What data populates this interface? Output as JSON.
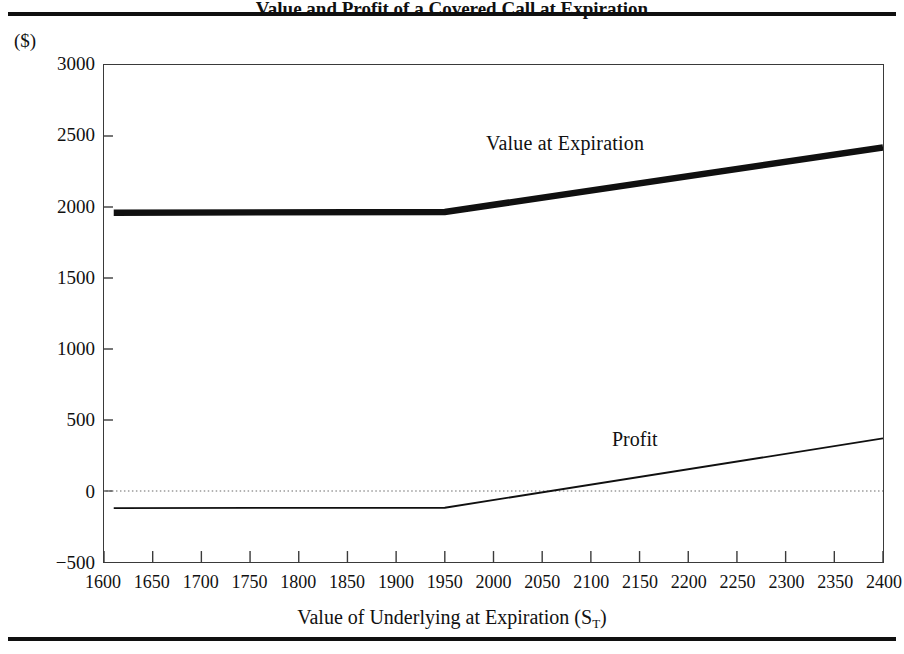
{
  "figure": {
    "caption": "Value and Profit of a Covered Call at Expiration",
    "unit_label": "($)"
  },
  "chart_data": {
    "type": "line",
    "title": "",
    "xlabel": "Value of Underlying at Expiration (S",
    "xlabel_sub": "T",
    "xlabel_suffix": ")",
    "ylabel": "($)",
    "xlim": [
      1600,
      2400
    ],
    "ylim": [
      -500,
      3000
    ],
    "xticks": [
      1600,
      1650,
      1700,
      1750,
      1800,
      1850,
      1900,
      1950,
      2000,
      2050,
      2100,
      2150,
      2200,
      2250,
      2300,
      2350,
      2400
    ],
    "yticks": [
      3000,
      2500,
      2000,
      1500,
      1000,
      500,
      0,
      -500
    ],
    "grid": false,
    "zero_line": {
      "value": 0,
      "style": "dotted"
    },
    "legend": "inline-annotations",
    "series": [
      {
        "name": "Value at Expiration",
        "style": "thick",
        "x": [
          1610,
          1950,
          2400
        ],
        "values": [
          1960,
          1965,
          2420
        ]
      },
      {
        "name": "Profit",
        "style": "thin",
        "x": [
          1610,
          1950,
          2400
        ],
        "values": [
          -120,
          -118,
          370
        ]
      }
    ],
    "annotations": [
      {
        "text": "Value at Expiration",
        "x": 2060,
        "y": 2350
      },
      {
        "text": "Profit",
        "x": 2190,
        "y": 580
      }
    ]
  },
  "colors": {
    "line": "#101010",
    "frame": "#3a3a3a",
    "zero_line": "#9a9a9a",
    "background": "#ffffff"
  }
}
